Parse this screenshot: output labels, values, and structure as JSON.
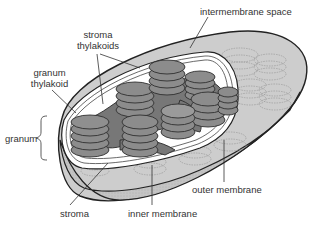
{
  "diagram": {
    "colors": {
      "background": "#ffffff",
      "grana_fill": "#8a8a8a",
      "grana_edge": "#3a3a3a",
      "stroma_thylakoid_fill": "#7a7a7a",
      "shell_fill": "#c9c9c9",
      "shell_dark": "#b0b0b0",
      "outline": "#222222",
      "label_text": "#333333",
      "leader_line": "#333333"
    },
    "labels": {
      "intermembrane_space": "intermembrane space",
      "stroma_thylakoids_line1": "stroma",
      "stroma_thylakoids_line2": "thylakoids",
      "granum_thylakoid_line1": "granum",
      "granum_thylakoid_line2": "thylakoid",
      "granum": "granum",
      "stroma": "stroma",
      "inner_membrane": "inner membrane",
      "outer_membrane": "outer membrane"
    }
  }
}
